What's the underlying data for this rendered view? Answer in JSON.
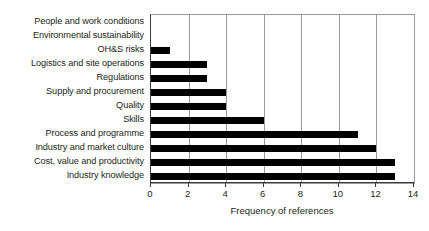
{
  "chart_data": {
    "type": "bar",
    "orientation": "horizontal",
    "title": "",
    "xlabel": "Frequency of references",
    "ylabel": "",
    "xlim": [
      0,
      14
    ],
    "xticks": [
      0,
      2,
      4,
      6,
      8,
      10,
      12,
      14
    ],
    "grid": "vertical",
    "legend": "none",
    "bar_color": "#000000",
    "categories": [
      "People and work conditions",
      "Environmental sustainability",
      "OH&S risks",
      "Logistics and site operations",
      "Regulations",
      "Supply and procurement",
      "Quality",
      "Skills",
      "Process and programme",
      "Industry and market culture",
      "Cost, value and productivity",
      "Industry knowledge"
    ],
    "values": [
      0,
      0,
      1,
      3,
      3,
      4,
      4,
      6,
      11,
      12,
      13,
      13
    ]
  }
}
